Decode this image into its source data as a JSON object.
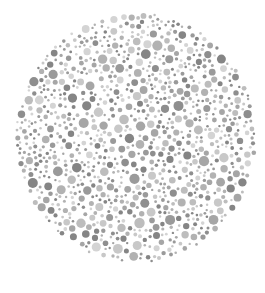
{
  "image": {
    "description": "Grayscale Ishihara-style color vision test plate: a circular field of densely packed dots of varying sizes and gray tones",
    "caption": "Color vision test plate (grayscale)"
  },
  "plate": {
    "center": [
      136,
      138
    ],
    "radius_x": 121,
    "radius_y": 126,
    "background": "#ffffff",
    "dot_tones": [
      "#d4d4d4",
      "#c8c8c8",
      "#bdbdbd",
      "#b2b2b2",
      "#a6a6a6",
      "#9a9a9a",
      "#8e8e8e",
      "#858585"
    ],
    "dot_radius_min": 1.2,
    "dot_radius_max": 5.2,
    "seed": 7
  }
}
